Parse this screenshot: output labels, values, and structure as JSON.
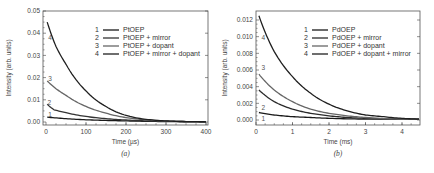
{
  "chart_data": [
    {
      "id": "a",
      "type": "line",
      "caption": "(a)",
      "title": "",
      "xlabel": "Time (µs)",
      "ylabel": "Intensity (arb. units)",
      "xlim": [
        0,
        400
      ],
      "ylim": [
        0,
        0.05
      ],
      "xticks": [
        0,
        100,
        200,
        300,
        400
      ],
      "xtick_labels": [
        "0",
        "100",
        "200",
        "300",
        "400"
      ],
      "yticks": [
        0.0,
        0.01,
        0.02,
        0.03,
        0.04,
        0.05
      ],
      "ytick_labels": [
        "0.00",
        "0.01",
        "0.02",
        "0.03",
        "0.04",
        "0.05"
      ],
      "grid": false,
      "legend_position": "upper right",
      "series": [
        {
          "name": "PtOEP",
          "index": "1",
          "color": "#1a1a1a",
          "x": [
            3,
            50,
            100,
            150,
            200,
            250,
            300,
            350,
            400
          ],
          "values": [
            0.0022,
            0.0015,
            0.001,
            0.0007,
            0.0005,
            0.0003,
            0.0002,
            0.0001,
            0.0001
          ]
        },
        {
          "name": "PtOEP + mirror",
          "index": "2",
          "color": "#333333",
          "x": [
            3,
            20,
            50,
            100,
            150,
            200,
            250,
            300,
            350,
            400
          ],
          "values": [
            0.008,
            0.0055,
            0.0042,
            0.0025,
            0.0015,
            0.0009,
            0.0005,
            0.0003,
            0.0002,
            0.0001
          ]
        },
        {
          "name": "PtOEP + dopant",
          "index": "3",
          "color": "#666666",
          "x": [
            3,
            25,
            50,
            100,
            150,
            200,
            250,
            300,
            350,
            400
          ],
          "values": [
            0.0185,
            0.015,
            0.012,
            0.007,
            0.004,
            0.002,
            0.001,
            0.0005,
            0.0002,
            0.0001
          ]
        },
        {
          "name": "PtOEP + mirror + dopant",
          "index": "4",
          "color": "#1f1f1f",
          "x": [
            3,
            25,
            50,
            100,
            150,
            200,
            250,
            300,
            350,
            400
          ],
          "values": [
            0.045,
            0.034,
            0.026,
            0.014,
            0.007,
            0.003,
            0.0012,
            0.0005,
            0.0002,
            0.0001
          ]
        }
      ],
      "curve_labels": [
        {
          "text": "4",
          "x": 3,
          "y": 0.038
        },
        {
          "text": "3",
          "x": 3,
          "y": 0.0195
        },
        {
          "text": "2",
          "x": 1,
          "y": 0.0085
        },
        {
          "text": "1",
          "x": 3,
          "y": 0.0032
        }
      ]
    },
    {
      "id": "b",
      "type": "line",
      "caption": "(b)",
      "title": "",
      "xlabel": "Time (ms)",
      "ylabel": "Intensity (arb. units)",
      "xlim": [
        0,
        4.5
      ],
      "ylim": [
        -0.0003,
        0.0128
      ],
      "xticks": [
        0,
        1,
        2,
        3,
        4
      ],
      "xtick_labels": [
        "0",
        "1",
        "2",
        "3",
        "4"
      ],
      "yticks": [
        0.0,
        0.002,
        0.004,
        0.006,
        0.008,
        0.01,
        0.012
      ],
      "ytick_labels": [
        "0.000",
        "0.002",
        "0.004",
        "0.006",
        "0.008",
        "0.010",
        "0.012"
      ],
      "grid": false,
      "legend_position": "upper right",
      "series": [
        {
          "name": "PdOEP",
          "index": "1",
          "color": "#1a1a1a",
          "x": [
            0.08,
            0.5,
            1.0,
            1.5,
            2.0,
            3.0,
            4.0,
            4.5
          ],
          "values": [
            0.0009,
            0.0006,
            0.0004,
            0.0003,
            0.0002,
            0.0001,
            0.0001,
            0.0001
          ]
        },
        {
          "name": "PdOEP + mirror",
          "index": "2",
          "color": "#2a2a2a",
          "x": [
            0.08,
            0.5,
            1.0,
            1.5,
            2.0,
            2.5,
            3.0,
            4.0,
            4.5
          ],
          "values": [
            0.0036,
            0.0022,
            0.0013,
            0.0008,
            0.0005,
            0.0003,
            0.0002,
            0.0001,
            0.0001
          ]
        },
        {
          "name": "PdOEP + dopant",
          "index": "3",
          "color": "#666666",
          "x": [
            0.08,
            0.5,
            1.0,
            1.5,
            2.0,
            2.5,
            3.0,
            4.0,
            4.5
          ],
          "values": [
            0.0055,
            0.0036,
            0.0022,
            0.0013,
            0.0008,
            0.0005,
            0.0003,
            0.0001,
            0.0001
          ]
        },
        {
          "name": "PdOEP + dopant + mirror",
          "index": "4",
          "color": "#1f1f1f",
          "x": [
            0.08,
            0.5,
            1.0,
            1.5,
            2.0,
            2.5,
            3.0,
            3.5,
            4.0,
            4.5
          ],
          "values": [
            0.0125,
            0.0082,
            0.0052,
            0.0032,
            0.0019,
            0.0011,
            0.0006,
            0.0004,
            0.0002,
            0.0001
          ]
        }
      ],
      "curve_labels": [
        {
          "text": "4",
          "x": 0.12,
          "y": 0.0098
        },
        {
          "text": "3",
          "x": 0.12,
          "y": 0.0062
        },
        {
          "text": "2",
          "x": 0.12,
          "y": 0.0015
        },
        {
          "text": "1",
          "x": 0.12,
          "y": 0.0001
        }
      ]
    }
  ]
}
